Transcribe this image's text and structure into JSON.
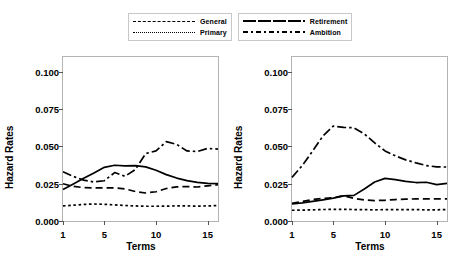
{
  "legend": {
    "entries": [
      {
        "label": "General",
        "style": "dashed"
      },
      {
        "label": "Primary",
        "style": "dotted"
      },
      {
        "label": "Retirement",
        "style": "solid"
      },
      {
        "label": "Ambition",
        "style": "dashdot"
      }
    ]
  },
  "chart_data": [
    {
      "type": "line",
      "panel": "left",
      "title": "",
      "xlabel": "Terms",
      "ylabel": "Hazard Rates",
      "x": [
        1,
        2,
        3,
        4,
        5,
        6,
        7,
        8,
        9,
        10,
        11,
        12,
        13,
        14,
        15,
        16
      ],
      "xlim": [
        1,
        16
      ],
      "ylim": [
        0.0,
        0.11
      ],
      "xticks": [
        1,
        5,
        10,
        15
      ],
      "yticks": [
        0.0,
        0.025,
        0.05,
        0.075,
        0.1
      ],
      "yticklabels": [
        "0.000",
        "0.025",
        "0.050",
        "0.075",
        "0.100"
      ],
      "grid": false,
      "legend_position": "top",
      "series": [
        {
          "name": "General",
          "style": "dashed",
          "values": [
            0.025,
            0.0232,
            0.0224,
            0.0222,
            0.0223,
            0.0222,
            0.0215,
            0.0198,
            0.0188,
            0.0196,
            0.0218,
            0.0229,
            0.0231,
            0.0228,
            0.0236,
            0.0243
          ]
        },
        {
          "name": "Primary",
          "style": "dotted",
          "values": [
            0.0101,
            0.0106,
            0.0111,
            0.0114,
            0.0112,
            0.0108,
            0.0104,
            0.0101,
            0.0099,
            0.0099,
            0.01,
            0.0101,
            0.0101,
            0.01,
            0.0101,
            0.0104
          ]
        },
        {
          "name": "Retirement",
          "style": "solid",
          "values": [
            0.0212,
            0.0249,
            0.0286,
            0.0322,
            0.036,
            0.0374,
            0.037,
            0.0371,
            0.0363,
            0.034,
            0.0311,
            0.0288,
            0.0271,
            0.0259,
            0.0252,
            0.0251
          ]
        },
        {
          "name": "Ambition",
          "style": "dashdot",
          "values": [
            0.0331,
            0.0299,
            0.0274,
            0.0262,
            0.027,
            0.0325,
            0.03,
            0.0345,
            0.0452,
            0.047,
            0.0532,
            0.0514,
            0.047,
            0.0466,
            0.0487,
            0.0482
          ]
        }
      ]
    },
    {
      "type": "line",
      "panel": "right",
      "title": "",
      "xlabel": "Terms",
      "ylabel": "Hazard Rates",
      "x": [
        1,
        2,
        3,
        4,
        5,
        6,
        7,
        8,
        9,
        10,
        11,
        12,
        13,
        14,
        15,
        16
      ],
      "xlim": [
        1,
        16
      ],
      "ylim": [
        0.0,
        0.11
      ],
      "xticks": [
        1,
        5,
        10,
        15
      ],
      "yticks": [
        0.0,
        0.025,
        0.05,
        0.075,
        0.1
      ],
      "yticklabels": [
        "0.000",
        "0.025",
        "0.050",
        "0.075",
        "0.100"
      ],
      "grid": false,
      "legend_position": "top",
      "series": [
        {
          "name": "General",
          "style": "dashed",
          "values": [
            0.0118,
            0.0131,
            0.0144,
            0.0152,
            0.0156,
            0.017,
            0.0152,
            0.0141,
            0.0137,
            0.0139,
            0.0144,
            0.0147,
            0.0148,
            0.0148,
            0.0148,
            0.0149
          ]
        },
        {
          "name": "Primary",
          "style": "dotted",
          "values": [
            0.0072,
            0.0073,
            0.0075,
            0.0077,
            0.0078,
            0.0078,
            0.0077,
            0.0076,
            0.0075,
            0.0076,
            0.0076,
            0.0076,
            0.0076,
            0.0075,
            0.0075,
            0.0077
          ]
        },
        {
          "name": "Retirement",
          "style": "solid",
          "values": [
            0.0114,
            0.0122,
            0.0132,
            0.0142,
            0.0153,
            0.0168,
            0.0172,
            0.0215,
            0.0262,
            0.0286,
            0.0277,
            0.0266,
            0.0258,
            0.026,
            0.0244,
            0.0252
          ]
        },
        {
          "name": "Ambition",
          "style": "dashdot",
          "values": [
            0.0293,
            0.0372,
            0.047,
            0.057,
            0.0637,
            0.0628,
            0.0625,
            0.0584,
            0.0524,
            0.047,
            0.0437,
            0.041,
            0.039,
            0.0372,
            0.0363,
            0.0362
          ]
        }
      ]
    }
  ]
}
